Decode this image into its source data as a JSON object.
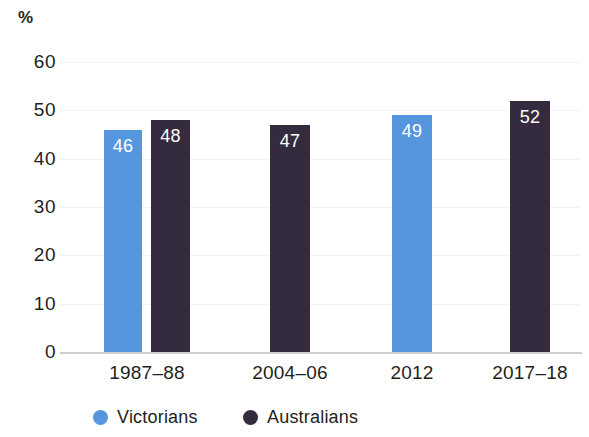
{
  "chart_data": {
    "type": "bar",
    "title": "",
    "subtitle": "",
    "xlabel": "",
    "ylabel": "%",
    "unit_label": "%",
    "categories": [
      "1987–88",
      "2004–06",
      "2012",
      "2017–18"
    ],
    "series": [
      {
        "name": "Victorians",
        "color": "#5596DE",
        "values": [
          46,
          null,
          49,
          null
        ]
      },
      {
        "name": "Australians",
        "color": "#352B3E",
        "values": [
          48,
          47,
          null,
          52
        ]
      }
    ],
    "bars": [
      {
        "category": "1987–88",
        "series": "Victorians",
        "value": 46,
        "label": "46",
        "color": "#5596DE",
        "x": 104,
        "width": 38
      },
      {
        "category": "1987–88",
        "series": "Australians",
        "value": 48,
        "label": "48",
        "color": "#352B3E",
        "x": 151,
        "width": 39
      },
      {
        "category": "2004–06",
        "series": "Australians",
        "value": 47,
        "label": "47",
        "color": "#352B3E",
        "x": 270,
        "width": 40
      },
      {
        "category": "2012",
        "series": "Victorians",
        "value": 49,
        "label": "49",
        "color": "#5596DE",
        "x": 392,
        "width": 40
      },
      {
        "category": "2017–18",
        "series": "Australians",
        "value": 52,
        "label": "52",
        "color": "#352B3E",
        "x": 510,
        "width": 40
      }
    ],
    "ylim": [
      0,
      60
    ],
    "yticks": [
      60,
      50,
      40,
      30,
      20,
      10,
      0
    ],
    "ytick_labels": [
      "60",
      "50",
      "40",
      "30",
      "20",
      "10",
      "0"
    ],
    "grid": true,
    "grid_color": "#f1f1f1",
    "axis_color": "#cfcfcf",
    "legend_position": "bottom-left",
    "legend": [
      {
        "label": "Victorians",
        "color": "#5596DE",
        "x": 93
      },
      {
        "label": "Australians",
        "color": "#352B3E",
        "x": 243
      }
    ],
    "category_label_positions": [
      {
        "label": "1987–88",
        "center": 147
      },
      {
        "label": "2004–06",
        "center": 290
      },
      {
        "label": "2012",
        "center": 412
      },
      {
        "label": "2017–18",
        "center": 530
      }
    ],
    "background": "#ffffff",
    "text_color": "#231f20",
    "data_label_color": "#ffffff"
  }
}
